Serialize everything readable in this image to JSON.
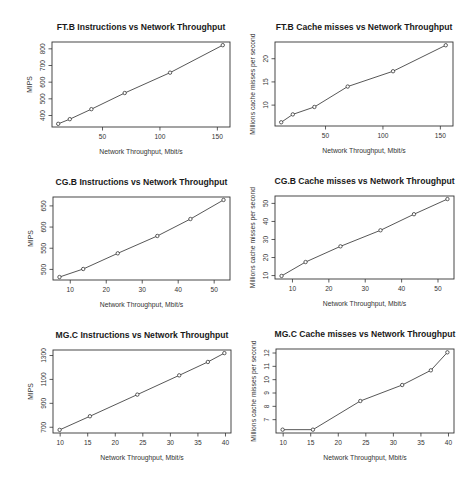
{
  "chart_data": [
    {
      "type": "line",
      "title": "FT.B Instructions vs Network Throughput",
      "xlabel": "Network Throughput, Mbit/s",
      "ylabel": "MIPS",
      "x": [
        11.4,
        21.5,
        40.3,
        69.3,
        108.8,
        154.7
      ],
      "values": [
        350,
        378,
        438,
        535,
        657,
        822
      ],
      "xticks": [
        50,
        100,
        150
      ],
      "yticks": [
        400,
        500,
        600,
        700,
        800
      ],
      "xlim": [
        6,
        161
      ],
      "ylim": [
        331,
        841
      ],
      "box": [
        52,
        42,
        230,
        127
      ]
    },
    {
      "type": "line",
      "title": "FT.B Cache misses vs Network Throughput",
      "xlabel": "Network Throughput, Mbit/s",
      "ylabel": "Millions cache misses per second",
      "x": [
        11.4,
        21.5,
        40.3,
        69.3,
        108.8,
        154.7
      ],
      "values": [
        6.3,
        8.0,
        9.6,
        14.0,
        17.3,
        22.9
      ],
      "xticks": [
        50,
        100,
        150
      ],
      "yticks": [
        10,
        15,
        20
      ],
      "xlim": [
        6,
        161
      ],
      "ylim": [
        5.5,
        23.6
      ],
      "box": [
        275,
        42,
        453,
        126
      ]
    },
    {
      "type": "line",
      "title": "CG.B Instructions vs Network Throughput",
      "xlabel": "Network Throughput, Mbit/s",
      "ylabel": "MIPS",
      "x": [
        7.0,
        13.6,
        23.2,
        34.2,
        43.4,
        52.6
      ],
      "values": [
        482,
        501,
        538,
        579,
        619,
        664
      ],
      "xticks": [
        10,
        20,
        30,
        40,
        50
      ],
      "yticks": [
        500,
        550,
        600,
        650
      ],
      "xlim": [
        5.2,
        54.4
      ],
      "ylim": [
        475,
        671
      ],
      "box": [
        53,
        197,
        230,
        280
      ]
    },
    {
      "type": "line",
      "title": "CG.B Cache misses vs Network Throughput",
      "xlabel": "Network Throughput, Mbit/s",
      "ylabel": "Millions cache misses per second",
      "x": [
        7.0,
        13.6,
        23.2,
        34.2,
        43.4,
        52.6
      ],
      "values": [
        9.8,
        17.5,
        26.2,
        35.1,
        44.0,
        52.4
      ],
      "xticks": [
        10,
        20,
        30,
        40,
        50
      ],
      "yticks": [
        10,
        20,
        30,
        40,
        50
      ],
      "xlim": [
        5.2,
        54.4
      ],
      "ylim": [
        8.1,
        54.1
      ],
      "box": [
        275,
        196,
        454,
        279
      ]
    },
    {
      "type": "line",
      "title": "MG.C Instructions vs Network Throughput",
      "xlabel": "Network Throughput, Mbit/s",
      "ylabel": "MIPS",
      "x": [
        9.9,
        15.4,
        24.0,
        31.6,
        36.8,
        39.8
      ],
      "values": [
        678,
        792,
        973,
        1134,
        1246,
        1320
      ],
      "xticks": [
        10,
        15,
        20,
        25,
        30,
        35,
        40
      ],
      "yticks": [
        700,
        900,
        1100,
        1300
      ],
      "xlim": [
        8.7,
        41.0
      ],
      "ylim": [
        652,
        1346
      ],
      "box": [
        53,
        350,
        231,
        433
      ]
    },
    {
      "type": "line",
      "title": "MG.C Cache misses vs Network Throughput",
      "xlabel": "Network Throughput, Mbit/s",
      "ylabel": "Millions cache misses per second",
      "x": [
        9.9,
        15.4,
        24.0,
        31.6,
        36.8,
        39.8
      ],
      "values": [
        6.25,
        6.25,
        8.4,
        9.6,
        10.7,
        12.05
      ],
      "xticks": [
        10,
        15,
        20,
        25,
        30,
        35,
        40
      ],
      "yticks": [
        7,
        8,
        9,
        10,
        11,
        12
      ],
      "xlim": [
        8.7,
        41.0
      ],
      "ylim": [
        6.0,
        12.3
      ],
      "box": [
        276,
        349,
        454,
        433
      ]
    }
  ]
}
